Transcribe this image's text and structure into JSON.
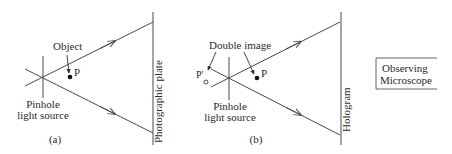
{
  "panel_a": {
    "caption": "(a)",
    "object_label": "Object",
    "point_label": "P",
    "source_label_line1": "Pinhole",
    "source_label_line2": "light source",
    "plate_label": "Photographic plate"
  },
  "panel_b": {
    "caption": "(b)",
    "double_image_label": "Double image",
    "point_label": "P",
    "virtual_point_label": "P'",
    "virtual_point_sub": "o",
    "source_label_line1": "Pinhole",
    "source_label_line2": "light source",
    "plate_label": "Hologram"
  },
  "microscope": {
    "label_line1": "Observing",
    "label_line2": "Microscope"
  },
  "colors": {
    "line": "#4a4a4a",
    "text": "#2a2a2a",
    "background": "#ffffff"
  }
}
